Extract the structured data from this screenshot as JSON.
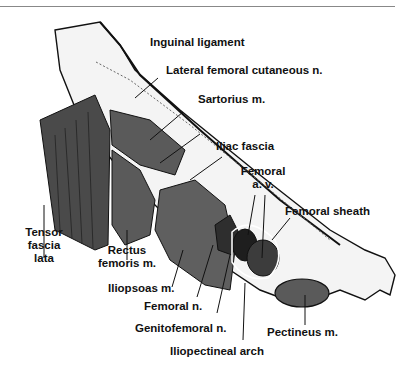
{
  "figure": {
    "labels": {
      "inguinal_ligament": "Inguinal ligament",
      "lateral_femoral_cutaneous": "Lateral femoral cutaneous n.",
      "sartorius": "Sartorius m.",
      "iliac_fascia": "Iliac fascia",
      "femoral_av_line1": "Femoral",
      "femoral_av_line2": "a. v.",
      "femoral_sheath": "Femoral sheath",
      "tensor_line1": "Tensor",
      "tensor_line2": "fascia",
      "tensor_line3": "lata",
      "rectus_line1": "Rectus",
      "rectus_line2": "femoris m.",
      "iliopsoas": "Iliopsoas m.",
      "femoral_n": "Femoral n.",
      "genitofemoral": "Genitofemoral n.",
      "pectineus": "Pectineus m.",
      "iliopectineal_arch": "Iliopectineal arch"
    },
    "colors": {
      "muscle": "#5a5a5a",
      "muscle_dark": "#2e2e2e",
      "vessel": "#3c3c3c",
      "bone": "#f4f4f4",
      "outline": "#111111"
    }
  }
}
